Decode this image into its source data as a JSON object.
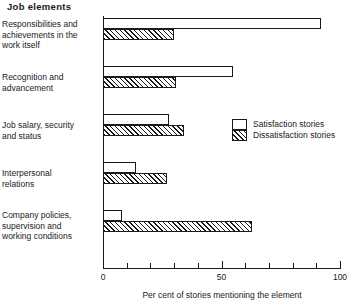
{
  "chart_data": {
    "type": "bar",
    "orientation": "horizontal",
    "title": "Job elements",
    "xlabel": "Per cent of stories mentioning the element",
    "ylabel": "",
    "xlim": [
      0,
      100
    ],
    "xticks": [
      0,
      50,
      100
    ],
    "xtick_labels": [
      "0",
      "50",
      "100"
    ],
    "minor_tick_step": 10,
    "grid": false,
    "legend_position": "middle-right",
    "categories": [
      "Responsibilities and\nachievements in the\nwork itself",
      "Recognition and\nadvancement",
      "Job salary, security\nand status",
      "Interpersonal\nrelations",
      "Company policies,\nsupervision and\nworking conditions"
    ],
    "series": [
      {
        "name": "Satisfaction stories",
        "fill": "white",
        "values": [
          92,
          55,
          28,
          14,
          8
        ]
      },
      {
        "name": "Dissatisfaction stories",
        "fill": "hatched",
        "values": [
          30,
          31,
          34,
          27,
          63
        ]
      }
    ]
  },
  "legend": {
    "items": [
      {
        "label": "Satisfaction stories"
      },
      {
        "label": "Dissatisfaction stories"
      }
    ]
  },
  "colors": {
    "ink": "#1a1a1a",
    "background": "#ffffff"
  }
}
